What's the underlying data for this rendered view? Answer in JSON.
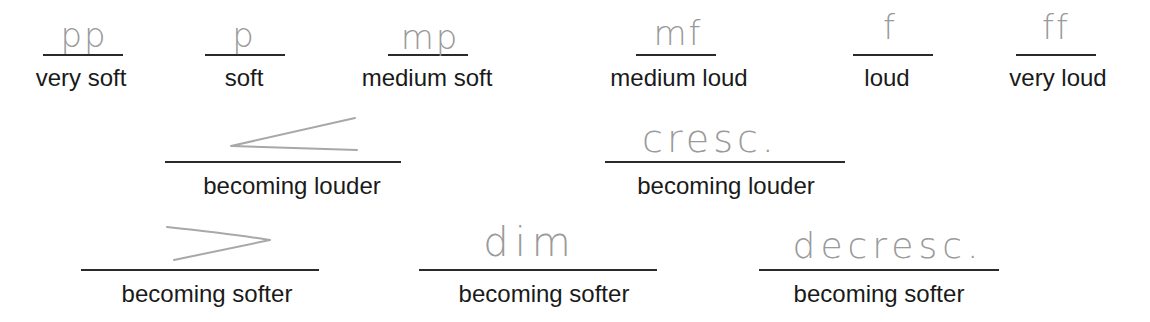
{
  "row1": [
    {
      "mark": "pp",
      "label": "very soft"
    },
    {
      "mark": "p",
      "label": "soft"
    },
    {
      "mark": "mp",
      "label": "medium soft"
    },
    {
      "mark": "mf",
      "label": "medium loud"
    },
    {
      "mark": "f",
      "label": "loud"
    },
    {
      "mark": "ff",
      "label": "very loud"
    }
  ],
  "row2": [
    {
      "mark": "crescendo-hairpin",
      "label": "becoming louder"
    },
    {
      "mark": "cresc.",
      "label": "becoming louder"
    }
  ],
  "row3": [
    {
      "mark": "decrescendo-hairpin",
      "label": "becoming softer"
    },
    {
      "mark": "dim",
      "label": "becoming softer"
    },
    {
      "mark": "decresc.",
      "label": "becoming softer"
    }
  ],
  "colors": {
    "ink": "#1a1a1a",
    "pencil": "#9a9a9a",
    "rule": "#2a2a2a"
  }
}
